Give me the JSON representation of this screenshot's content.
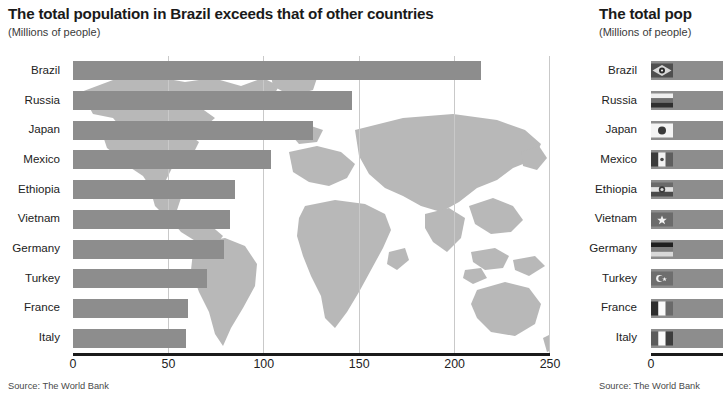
{
  "left": {
    "title": "The total population in Brazil exceeds that of other countries",
    "subtitle": "(Millions of people)",
    "source": "Source: The World Bank"
  },
  "right": {
    "title": "The total pop",
    "subtitle": "(Millions of people)",
    "source": "Source: The World Bank"
  },
  "chart_data": [
    {
      "type": "bar",
      "orientation": "horizontal",
      "title": "The total population in Brazil exceeds that of other countries",
      "subtitle": "(Millions of people)",
      "xlabel": "",
      "ylabel": "",
      "xlim": [
        0,
        250
      ],
      "xticks": [
        0,
        50,
        100,
        150,
        200,
        250
      ],
      "xticklabels": [
        "0",
        "50",
        "100",
        "150",
        "200",
        "250"
      ],
      "grid": "vertical-dashed",
      "legend": "none",
      "background": "world-map",
      "bar_color": "#8d8d8d",
      "source": "Source: The World Bank",
      "categories": [
        "Brazil",
        "Russia",
        "Japan",
        "Mexico",
        "Ethiopia",
        "Vietnam",
        "Germany",
        "Turkey",
        "France",
        "Italy"
      ],
      "values": [
        214,
        146,
        126,
        104,
        85,
        82,
        79,
        70,
        60,
        59
      ]
    },
    {
      "type": "bar",
      "orientation": "horizontal",
      "title": "The total pop",
      "subtitle": "(Millions of people)",
      "xlabel": "",
      "ylabel": "",
      "xlim": [
        0,
        250
      ],
      "xticks": [
        0
      ],
      "xticklabels": [
        "0"
      ],
      "grid": "none",
      "legend": "none",
      "background": "none",
      "bar_color": "#8d8d8d",
      "source": "Source: The World Bank",
      "note": "panel truncated at right edge of screenshot; bars start with national flag icons",
      "categories": [
        "Brazil",
        "Russia",
        "Japan",
        "Mexico",
        "Ethiopia",
        "Vietnam",
        "Germany",
        "Turkey",
        "France",
        "Italy"
      ],
      "values": [
        214,
        146,
        126,
        104,
        85,
        82,
        79,
        70,
        60,
        59
      ]
    }
  ],
  "flags": [
    {
      "country": "Brazil",
      "name": "flag-brazil-icon"
    },
    {
      "country": "Russia",
      "name": "flag-russia-icon"
    },
    {
      "country": "Japan",
      "name": "flag-japan-icon"
    },
    {
      "country": "Mexico",
      "name": "flag-mexico-icon"
    },
    {
      "country": "Ethiopia",
      "name": "flag-ethiopia-icon"
    },
    {
      "country": "Vietnam",
      "name": "flag-vietnam-icon"
    },
    {
      "country": "Germany",
      "name": "flag-germany-icon"
    },
    {
      "country": "Turkey",
      "name": "flag-turkey-icon"
    },
    {
      "country": "France",
      "name": "flag-france-icon"
    },
    {
      "country": "Italy",
      "name": "flag-italy-icon"
    }
  ]
}
